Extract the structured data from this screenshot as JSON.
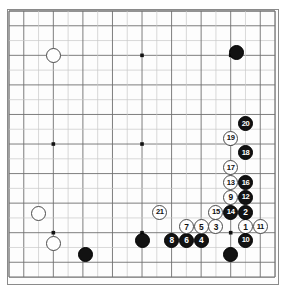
{
  "diagram": {
    "title": "Go game record diagram",
    "board_size": 19,
    "geometry": {
      "origin_x": 9,
      "origin_y": 11,
      "spacing": 14.78,
      "stone_diameter": 15,
      "numbered_stone_diameter": 15
    },
    "colors": {
      "board_background": "#fdfdfd",
      "page_background": "#ffffff",
      "grid_line": "#6f6f6f",
      "grid_line_light": "#c9c9c9",
      "border": "#8a8a8a",
      "black_stone": "#121212",
      "white_stone": "#fefefe",
      "white_stone_outline": "#4a4a4a",
      "black_label_text": "#ffffff",
      "white_label_text": "#111111"
    },
    "star_points": [
      {
        "col": 3,
        "row": 3
      },
      {
        "col": 9,
        "row": 3
      },
      {
        "col": 15,
        "row": 3
      },
      {
        "col": 3,
        "row": 9
      },
      {
        "col": 9,
        "row": 9
      },
      {
        "col": 15,
        "row": 9
      },
      {
        "col": 3,
        "row": 15
      },
      {
        "col": 9,
        "row": 15
      },
      {
        "col": 15,
        "row": 15
      }
    ],
    "stones": [
      {
        "id": "white-upper-left-corner",
        "color": "white",
        "col": 3,
        "row": 3,
        "label": ""
      },
      {
        "id": "white-lower-left-upper",
        "color": "white",
        "col": 2,
        "row": 13.7,
        "label": ""
      },
      {
        "id": "white-lower-left-lower",
        "color": "white",
        "col": 3,
        "row": 15.7,
        "label": ""
      },
      {
        "id": "black-upper-right-corner",
        "color": "black",
        "col": 15.4,
        "row": 2.8,
        "label": ""
      },
      {
        "id": "black-lower-left",
        "color": "black",
        "col": 5.2,
        "row": 16.5,
        "label": ""
      },
      {
        "id": "black-lower-center",
        "color": "black",
        "col": 9,
        "row": 15.5,
        "label": ""
      },
      {
        "id": "black-lower-right",
        "color": "black",
        "col": 15,
        "row": 16.5,
        "label": ""
      },
      {
        "id": "move-1",
        "color": "white",
        "col": 16,
        "row": 14.6,
        "label": "1"
      },
      {
        "id": "move-2",
        "color": "black",
        "col": 16,
        "row": 13.6,
        "label": "2"
      },
      {
        "id": "move-3",
        "color": "white",
        "col": 14,
        "row": 14.6,
        "label": "3"
      },
      {
        "id": "move-4",
        "color": "black",
        "col": 13,
        "row": 15.5,
        "label": "4"
      },
      {
        "id": "move-5",
        "color": "white",
        "col": 13,
        "row": 14.6,
        "label": "5"
      },
      {
        "id": "move-6",
        "color": "black",
        "col": 12,
        "row": 15.5,
        "label": "6"
      },
      {
        "id": "move-7",
        "color": "white",
        "col": 12,
        "row": 14.6,
        "label": "7"
      },
      {
        "id": "move-8",
        "color": "black",
        "col": 11,
        "row": 15.5,
        "label": "8"
      },
      {
        "id": "move-9",
        "color": "white",
        "col": 15,
        "row": 12.6,
        "label": "9"
      },
      {
        "id": "move-10",
        "color": "black",
        "col": 16,
        "row": 15.5,
        "label": "10"
      },
      {
        "id": "move-11",
        "color": "white",
        "col": 17,
        "row": 14.6,
        "label": "11"
      },
      {
        "id": "move-12",
        "color": "black",
        "col": 16,
        "row": 12.6,
        "label": "12"
      },
      {
        "id": "move-13",
        "color": "white",
        "col": 15,
        "row": 11.6,
        "label": "13"
      },
      {
        "id": "move-14",
        "color": "black",
        "col": 15,
        "row": 13.6,
        "label": "14"
      },
      {
        "id": "move-15",
        "color": "white",
        "col": 14,
        "row": 13.6,
        "label": "15"
      },
      {
        "id": "move-16",
        "color": "black",
        "col": 16,
        "row": 11.6,
        "label": "16"
      },
      {
        "id": "move-17",
        "color": "white",
        "col": 15,
        "row": 10.6,
        "label": "17"
      },
      {
        "id": "move-18",
        "color": "black",
        "col": 16,
        "row": 9.6,
        "label": "18"
      },
      {
        "id": "move-19",
        "color": "white",
        "col": 15,
        "row": 8.6,
        "label": "19"
      },
      {
        "id": "move-20",
        "color": "black",
        "col": 16,
        "row": 7.6,
        "label": "20"
      },
      {
        "id": "move-21",
        "color": "white",
        "col": 10.2,
        "row": 13.6,
        "label": "21"
      }
    ]
  }
}
